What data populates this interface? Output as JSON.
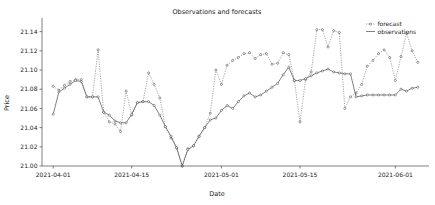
{
  "chart_data": {
    "type": "line",
    "title": "Observations and forecasts",
    "xlabel": "Date",
    "ylabel": "Price",
    "grid": false,
    "legend_position": "upper right",
    "ylim": [
      21.0,
      21.15
    ],
    "yticks": [
      "21.00",
      "21.02",
      "21.04",
      "21.06",
      "21.08",
      "21.10",
      "21.12",
      "21.14"
    ],
    "ytick_values": [
      21.0,
      21.02,
      21.04,
      21.06,
      21.08,
      21.1,
      21.12,
      21.14
    ],
    "xticks": [
      "2021-04-01",
      "2021-04-15",
      "2021-05-01",
      "2021-05-15",
      "2021-06-01"
    ],
    "xtick_values": [
      0,
      14,
      30,
      44,
      61
    ],
    "xlim": [
      -2,
      67
    ],
    "colors": {
      "forecast": "#6b6b6b",
      "observations": "#4a4a4a",
      "marker_face": "#ffffff",
      "marker_edge": "#3a3a3a",
      "axes": "#2b2b2b",
      "text": "#1a1a1a",
      "background": "#ffffff"
    },
    "series": [
      {
        "name": "forecast",
        "style": "dotted-with-markers",
        "x": [
          0,
          1,
          2,
          3,
          4,
          5,
          6,
          7,
          8,
          9,
          10,
          11,
          12,
          13,
          14,
          15,
          16,
          17,
          18,
          19,
          20,
          21,
          22,
          23,
          24,
          25,
          26,
          27,
          28,
          29,
          30,
          31,
          32,
          33,
          34,
          35,
          36,
          37,
          38,
          39,
          40,
          41,
          42,
          43,
          44,
          45,
          46,
          47,
          48,
          49,
          50,
          51,
          52,
          53,
          54,
          55,
          56,
          57,
          58,
          59,
          60,
          61,
          62,
          63,
          64,
          65
        ],
        "values": [
          21.083,
          21.079,
          21.084,
          21.088,
          21.09,
          21.09,
          21.072,
          21.072,
          21.121,
          21.056,
          21.046,
          21.044,
          21.036,
          21.078,
          21.053,
          21.066,
          21.067,
          21.097,
          21.085,
          21.071,
          21.041,
          21.029,
          21.019,
          21.0,
          21.018,
          21.021,
          21.031,
          21.04,
          21.055,
          21.1,
          21.085,
          21.105,
          21.11,
          21.113,
          21.117,
          21.118,
          21.112,
          21.116,
          21.117,
          21.106,
          21.107,
          21.118,
          21.116,
          21.089,
          21.046,
          21.09,
          21.098,
          21.142,
          21.142,
          21.124,
          21.141,
          21.139,
          21.06,
          21.072,
          21.076,
          21.085,
          21.104,
          21.11,
          21.117,
          21.121,
          21.113,
          21.089,
          21.114,
          21.138,
          21.12,
          21.108
        ]
      },
      {
        "name": "observations",
        "style": "solid-with-markers",
        "x": [
          0,
          1,
          2,
          3,
          4,
          5,
          6,
          7,
          8,
          9,
          10,
          11,
          12,
          13,
          14,
          15,
          16,
          17,
          18,
          19,
          20,
          21,
          22,
          23,
          24,
          25,
          26,
          27,
          28,
          29,
          30,
          31,
          32,
          33,
          34,
          35,
          36,
          37,
          38,
          39,
          40,
          41,
          42,
          43,
          44,
          45,
          46,
          47,
          48,
          49,
          50,
          51,
          52,
          53,
          54,
          55,
          56,
          57,
          58,
          59,
          60,
          61,
          62,
          63,
          64,
          65
        ],
        "values": [
          21.054,
          21.077,
          21.081,
          21.085,
          21.089,
          21.088,
          21.072,
          21.072,
          21.072,
          21.056,
          21.053,
          21.047,
          21.045,
          21.045,
          21.054,
          21.066,
          21.067,
          21.067,
          21.063,
          21.053,
          21.041,
          21.031,
          21.019,
          21.0,
          21.017,
          21.021,
          21.031,
          21.04,
          21.048,
          21.05,
          21.058,
          21.063,
          21.06,
          21.067,
          21.073,
          21.076,
          21.072,
          21.074,
          21.078,
          21.082,
          21.086,
          21.095,
          21.103,
          21.089,
          21.089,
          21.091,
          21.094,
          21.097,
          21.099,
          21.101,
          21.098,
          21.097,
          21.096,
          21.096,
          21.072,
          21.073,
          21.074,
          21.074,
          21.074,
          21.074,
          21.074,
          21.074,
          21.08,
          21.078,
          21.081,
          21.082
        ]
      }
    ]
  },
  "legend": {
    "items": [
      {
        "label": "forecast",
        "marker": "dotted-line-marker-icon"
      },
      {
        "label": "observations",
        "marker": "solid-line-icon"
      }
    ]
  }
}
